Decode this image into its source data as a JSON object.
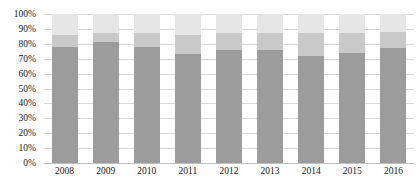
{
  "chart_data": {
    "type": "bar",
    "stacked": true,
    "stack_mode": "percent",
    "title": "",
    "subtitle": "",
    "xlabel": "",
    "ylabel": "",
    "ylim": [
      0,
      100
    ],
    "ytick_labels": [
      "0%",
      "10%",
      "20%",
      "30%",
      "40%",
      "50%",
      "60%",
      "70%",
      "80%",
      "90%",
      "100%"
    ],
    "ytick_values": [
      0,
      10,
      20,
      30,
      40,
      50,
      60,
      70,
      80,
      90,
      100
    ],
    "grid": true,
    "legend": "none",
    "categories": [
      "2008",
      "2009",
      "2010",
      "2011",
      "2012",
      "2013",
      "2014",
      "2015",
      "2016"
    ],
    "series": [
      {
        "name": "series-1",
        "color": "#9c9c9c",
        "values": [
          78,
          81,
          78,
          73,
          76,
          76,
          72,
          74,
          77
        ]
      },
      {
        "name": "series-2",
        "color": "#c9c9c9",
        "values": [
          8,
          6,
          9,
          13,
          11,
          11,
          15,
          13,
          11
        ]
      },
      {
        "name": "series-3",
        "color": "#e6e6e6",
        "values": [
          14,
          13,
          13,
          14,
          13,
          13,
          13,
          13,
          12
        ]
      }
    ],
    "colors": {
      "series_1": "#9c9c9c",
      "series_2": "#c9c9c9",
      "series_3": "#e6e6e6",
      "gridline": "#d9d9d9",
      "axis": "#bfbfbf",
      "text": "#1a1a1a",
      "background": "#ffffff"
    }
  }
}
